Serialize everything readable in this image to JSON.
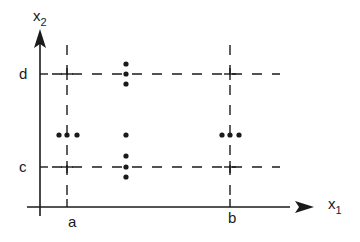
{
  "diagram": {
    "axes": {
      "x_label": "x",
      "x_subscript": "1",
      "y_label": "x",
      "y_subscript": "2"
    },
    "ticks": {
      "x": [
        "a",
        "b"
      ],
      "y": [
        "c",
        "d"
      ]
    },
    "grid_lines": {
      "vertical_at": [
        "a",
        "b"
      ],
      "horizontal_at": [
        "c",
        "d"
      ],
      "style": "dashed"
    },
    "point_clusters": [
      {
        "location": "(a, midpoint)",
        "arrangement": "horizontal",
        "count": 3
      },
      {
        "location": "(midpoint, d)",
        "arrangement": "vertical",
        "count": 3
      },
      {
        "location": "(midpoint, midpoint)",
        "arrangement": "single",
        "count": 1
      },
      {
        "location": "(midpoint, c)",
        "arrangement": "vertical",
        "count": 3
      },
      {
        "location": "(b, midpoint)",
        "arrangement": "horizontal",
        "count": 3
      }
    ],
    "colors": {
      "ink": "#1a1a1a",
      "background": "#ffffff"
    }
  }
}
